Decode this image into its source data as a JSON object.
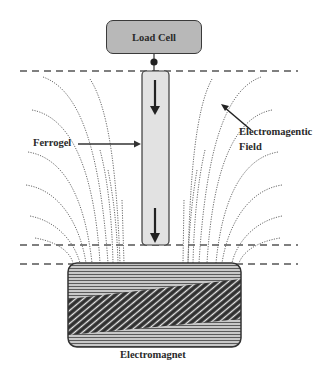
{
  "diagram": {
    "type": "schematic"
  },
  "labels": {
    "load_cell": "Load Cell",
    "ferrogel": "Ferrogel",
    "field_line1": "Electromagentic",
    "field_line2": "Field",
    "electromagnet": "Electromagnet"
  },
  "colors": {
    "load_cell_fill": "#b8b8b8",
    "rod_fill": "#e2e2e2",
    "outline": "#3a3a3a",
    "field_lines": "#6a6a6a",
    "dashed_lines": "#555555",
    "magnet_fill": "#9c9c9c"
  },
  "elements": [
    {
      "id": "load-cell",
      "kind": "box",
      "label": "Load Cell"
    },
    {
      "id": "ferrogel-rod",
      "kind": "rod",
      "arrows": [
        "down",
        "down"
      ]
    },
    {
      "id": "electromagnetic-field",
      "kind": "dotted-field-lines"
    },
    {
      "id": "boundary-lines",
      "kind": "dashed",
      "count": 3
    },
    {
      "id": "electromagnet",
      "kind": "coil-block",
      "label": "Electromagnet"
    }
  ]
}
